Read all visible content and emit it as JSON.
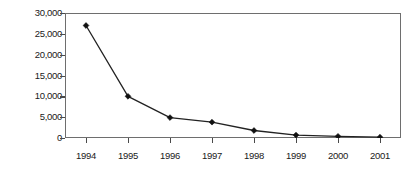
{
  "chart_data": {
    "type": "line",
    "title": "",
    "xlabel": "",
    "ylabel": "Handset price (yuan)",
    "categories": [
      "1994",
      "1995",
      "1996",
      "1997",
      "1998",
      "1999",
      "2000",
      "2001"
    ],
    "values": [
      27000,
      10000,
      4900,
      3800,
      1800,
      700,
      400,
      200
    ],
    "series": [
      {
        "name": "Handset price",
        "values": [
          27000,
          10000,
          4900,
          3800,
          1800,
          700,
          400,
          200
        ]
      }
    ],
    "ylim": [
      0,
      30000
    ],
    "y_ticks": [
      0,
      5000,
      10000,
      15000,
      20000,
      25000,
      30000
    ],
    "y_tick_labels": [
      "0",
      "5,000",
      "10,000",
      "15,000",
      "20,000",
      "25,000",
      "30,000"
    ],
    "x_tick_labels": [
      "1994",
      "1995",
      "1996",
      "1997",
      "1998",
      "1999",
      "2000",
      "2001"
    ],
    "grid": false,
    "legend": false,
    "legend_position": "none",
    "marker": "diamond",
    "line_color": "#222222",
    "marker_color": "#111111",
    "frame_color": "#6e6e6e",
    "background_color": "#ffffff"
  }
}
